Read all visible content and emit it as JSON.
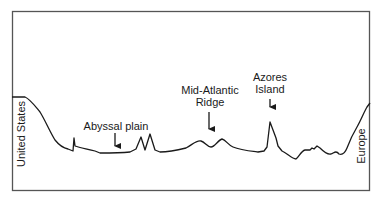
{
  "diagram": {
    "type": "ocean-floor-profile",
    "left_landmass": "United States",
    "right_landmass": "Europe",
    "features": [
      {
        "id": "abyssal-plain",
        "lines": [
          "Abyssal plain"
        ]
      },
      {
        "id": "mid-atlantic-ridge",
        "lines": [
          "Mid-Atlantic",
          "Ridge"
        ]
      },
      {
        "id": "azores-island",
        "lines": [
          "Azores",
          "Island"
        ]
      }
    ],
    "colors": {
      "line": "#1a1a1a",
      "frame": "#555555",
      "background": "#ffffff"
    }
  }
}
